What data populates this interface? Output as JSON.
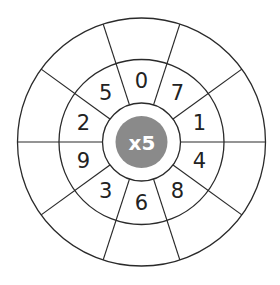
{
  "worksheet": {
    "title": "Multiplication wheel",
    "multiplier_label": "x5",
    "multiplier": 5,
    "center_fill": "#8a8a8a",
    "line_color": "#2a2a2a",
    "numbers": [
      {
        "value": "0",
        "angle": 0
      },
      {
        "value": "7",
        "angle": 36
      },
      {
        "value": "1",
        "angle": 72
      },
      {
        "value": "4",
        "angle": 108
      },
      {
        "value": "8",
        "angle": 144
      },
      {
        "value": "6",
        "angle": 180
      },
      {
        "value": "3",
        "angle": 216
      },
      {
        "value": "9",
        "angle": 252
      },
      {
        "value": "2",
        "angle": 288
      },
      {
        "value": "5",
        "angle": 324
      }
    ],
    "answers": [
      "",
      "",
      "",
      "",
      "",
      "",
      "",
      "",
      "",
      ""
    ]
  }
}
